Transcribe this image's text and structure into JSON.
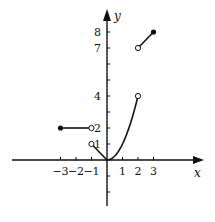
{
  "figure": {
    "type": "piecewise function graph",
    "axes": {
      "x_label": "x",
      "y_label": "y",
      "x_ticks": [
        -3,
        -2,
        -1,
        1,
        2,
        3
      ],
      "x_tick_labels": [
        "−3",
        "−2",
        "−1",
        "1",
        "2",
        "3"
      ],
      "y_ticks": [
        -2,
        -1,
        1,
        2,
        3,
        4,
        5,
        6,
        7,
        8
      ],
      "y_tick_labels": [
        {
          "value": 1,
          "label": "1"
        },
        {
          "value": 2,
          "label": "2"
        },
        {
          "value": 4,
          "label": "4"
        },
        {
          "value": 7,
          "label": "7"
        },
        {
          "value": 8,
          "label": "8"
        }
      ],
      "x_range": [
        -6.2,
        6.2
      ],
      "y_range": [
        -2.9,
        9.4
      ]
    },
    "pieces": [
      {
        "kind": "segment",
        "from": [
          -3,
          2
        ],
        "to": [
          -1,
          2
        ],
        "start": "closed",
        "end": "open"
      },
      {
        "kind": "segment",
        "from": [
          -1,
          1
        ],
        "to": [
          0,
          0
        ],
        "start": "open",
        "end": "none"
      },
      {
        "kind": "parabola",
        "expr": "y = x^2",
        "from": [
          0,
          0
        ],
        "to": [
          2,
          4
        ],
        "start": "none",
        "end": "open"
      },
      {
        "kind": "segment",
        "from": [
          2,
          7
        ],
        "to": [
          3,
          8
        ],
        "start": "open",
        "end": "closed"
      }
    ],
    "colors": {
      "ink": "#111111",
      "background": "#ffffff"
    }
  }
}
